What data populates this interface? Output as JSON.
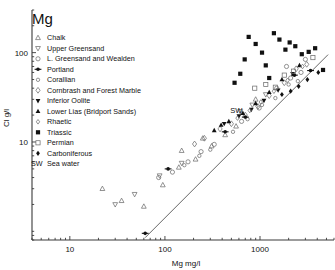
{
  "chart_data": {
    "type": "scatter",
    "title": "Mg",
    "xlabel": "Mg mg/l",
    "ylabel": "Cl g/l",
    "xscale": "log",
    "yscale": "log",
    "xlim": [
      4,
      6000
    ],
    "ylim": [
      0.8,
      300
    ],
    "xticks": [
      10,
      100,
      1000
    ],
    "xticklabels": [
      "10",
      "100",
      "1000"
    ],
    "yticks": [
      10,
      100
    ],
    "yticklabels": [
      "10",
      "100"
    ],
    "grid": false,
    "legend_position": "upper-left-inside",
    "annotations": [
      {
        "text": "SW",
        "x": 700,
        "y": 19,
        "note": "Sea water reference point on trend line"
      }
    ],
    "trend_line": {
      "label": "sea-water dilution line",
      "x0": 62,
      "y0": 0.85,
      "x1": 5200,
      "y1": 95
    },
    "series": [
      {
        "name": "Chalk",
        "marker": "triangle-up-open",
        "filled": false,
        "points": [
          [
            95,
            3.3
          ],
          [
            140,
            5.2
          ],
          [
            210,
            6.4
          ],
          [
            310,
            9.0
          ],
          [
            430,
            12.0
          ],
          [
            560,
            15.0
          ],
          [
            22,
            3.0
          ],
          [
            35,
            2.2
          ],
          [
            60,
            1.9
          ],
          [
            150,
            8.0
          ],
          [
            250,
            11.0
          ],
          [
            900,
            30.0
          ]
        ]
      },
      {
        "name": "Upper Greensand",
        "marker": "triangle-down-open",
        "filled": false,
        "points": [
          [
            48,
            2.6
          ],
          [
            88,
            4.2
          ],
          [
            150,
            5.8
          ],
          [
            620,
            22.0
          ],
          [
            830,
            26.0
          ],
          [
            1150,
            34.0
          ],
          [
            30,
            2.0
          ]
        ]
      },
      {
        "name": "L. Greensand and Wealden",
        "marker": "circle-open",
        "filled": false,
        "points": [
          [
            120,
            4.6
          ],
          [
            175,
            6.0
          ],
          [
            240,
            7.8
          ],
          [
            330,
            9.4
          ],
          [
            640,
            17.0
          ],
          [
            980,
            24.0
          ],
          [
            1500,
            40.0
          ],
          [
            2100,
            52.0
          ],
          [
            2700,
            60.0
          ],
          [
            1900,
            70.0
          ],
          [
            3000,
            84.0
          ],
          [
            86,
            4.0
          ]
        ]
      },
      {
        "name": "Portland",
        "marker": "dot-bar-filled",
        "filled": true,
        "points": [
          [
            62,
            0.95
          ],
          [
            108,
            5.0
          ],
          [
            430,
            13.0
          ],
          [
            2300,
            56.0
          ],
          [
            3400,
            63.0
          ]
        ]
      },
      {
        "name": "Corallian",
        "marker": "circle-small-open",
        "filled": false,
        "points": [
          [
            160,
            5.5
          ],
          [
            230,
            7.0
          ],
          [
            300,
            8.2
          ],
          [
            520,
            13.0
          ],
          [
            740,
            18.0
          ],
          [
            1050,
            26.0
          ],
          [
            1450,
            31.0
          ],
          [
            2000,
            44.0
          ],
          [
            2500,
            48.0
          ]
        ]
      },
      {
        "name": "Cornbrash and Forest Marble",
        "marker": "diamond-open",
        "filled": false,
        "points": [
          [
            260,
            11.0
          ],
          [
            380,
            14.0
          ],
          [
            500,
            16.0
          ],
          [
            700,
            20.0
          ],
          [
            950,
            25.0
          ],
          [
            1250,
            33.0
          ],
          [
            1800,
            46.0
          ],
          [
            2400,
            66.0
          ],
          [
            3100,
            74.0
          ],
          [
            205,
            9.5
          ]
        ]
      },
      {
        "name": "Inferior Oolite",
        "marker": "triangle-down-filled",
        "filled": true,
        "points": [
          [
            420,
            16.0
          ],
          [
            600,
            19.5
          ],
          [
            810,
            23.0
          ],
          [
            1100,
            29.0
          ],
          [
            1550,
            38.0
          ],
          [
            2200,
            58.0
          ]
        ]
      },
      {
        "name": "Lower Lias (Bridport Sands)",
        "marker": "triangle-up-filled",
        "filled": true,
        "points": [
          [
            330,
            13.5
          ],
          [
            470,
            17.0
          ],
          [
            660,
            21.0
          ],
          [
            900,
            27.0
          ],
          [
            1250,
            36.0
          ],
          [
            1700,
            50.0
          ],
          [
            2600,
            72.0
          ],
          [
            390,
            15.5
          ]
        ]
      },
      {
        "name": "Rhaetic",
        "marker": "diamond-small-open",
        "filled": false,
        "points": [
          [
            580,
            18.5
          ],
          [
            780,
            22.5
          ],
          [
            1020,
            28.0
          ],
          [
            1400,
            37.0
          ],
          [
            1950,
            49.0
          ],
          [
            2800,
            70.0
          ]
        ]
      },
      {
        "name": "Triassic",
        "marker": "square-filled",
        "filled": true,
        "points": [
          [
            540,
            46.0
          ],
          [
            690,
            84.0
          ],
          [
            760,
            150.0
          ],
          [
            900,
            125.0
          ],
          [
            1050,
            100.0
          ],
          [
            1150,
            72.0
          ],
          [
            1400,
            165.0
          ],
          [
            1600,
            140.0
          ],
          [
            1850,
            108.0
          ],
          [
            2050,
            130.0
          ],
          [
            2350,
            118.0
          ],
          [
            2750,
            96.0
          ],
          [
            3250,
            102.0
          ],
          [
            3800,
            112.0
          ],
          [
            4600,
            64.0
          ],
          [
            620,
            58.0
          ],
          [
            1250,
            52.0
          ]
        ]
      },
      {
        "name": "Permian",
        "marker": "square-open",
        "filled": false,
        "points": [
          [
            1150,
            44.0
          ],
          [
            1450,
            41.0
          ],
          [
            1800,
            56.0
          ],
          [
            2250,
            62.0
          ],
          [
            3600,
            88.0
          ],
          [
            880,
            40.0
          ]
        ]
      },
      {
        "name": "Carboniferous",
        "marker": "diamond-filled",
        "filled": true,
        "points": [
          [
            1700,
            34.0
          ],
          [
            2100,
            37.0
          ],
          [
            2550,
            42.0
          ],
          [
            3150,
            50.0
          ],
          [
            4100,
            60.0
          ]
        ]
      }
    ]
  },
  "legend": {
    "items": [
      {
        "label": "Chalk",
        "marker": "triangle-up-open"
      },
      {
        "label": "Upper Greensand",
        "marker": "triangle-down-open"
      },
      {
        "label": "L. Greensand and Wealden",
        "marker": "circle-open"
      },
      {
        "label": "Portland",
        "marker": "dot-bar-filled"
      },
      {
        "label": "Corallian",
        "marker": "circle-small-open"
      },
      {
        "label": "Cornbrash and Forest Marble",
        "marker": "diamond-open"
      },
      {
        "label": "Inferior Oolite",
        "marker": "triangle-down-filled"
      },
      {
        "label": "Lower Lias (Bridport Sands)",
        "marker": "triangle-up-filled"
      },
      {
        "label": "Rhaetic",
        "marker": "diamond-small-open"
      },
      {
        "label": "Triassic",
        "marker": "square-filled"
      },
      {
        "label": "Permian",
        "marker": "square-open"
      },
      {
        "label": "Carboniferous",
        "marker": "diamond-filled"
      }
    ],
    "footnote_key": "SW",
    "footnote_text": "Sea water"
  },
  "colors": {
    "ink": "#1a1a1a",
    "axis": "#3a3a3a",
    "background": "#ffffff",
    "marker_open": "#6f6f6f",
    "marker_filled": "#111111"
  }
}
